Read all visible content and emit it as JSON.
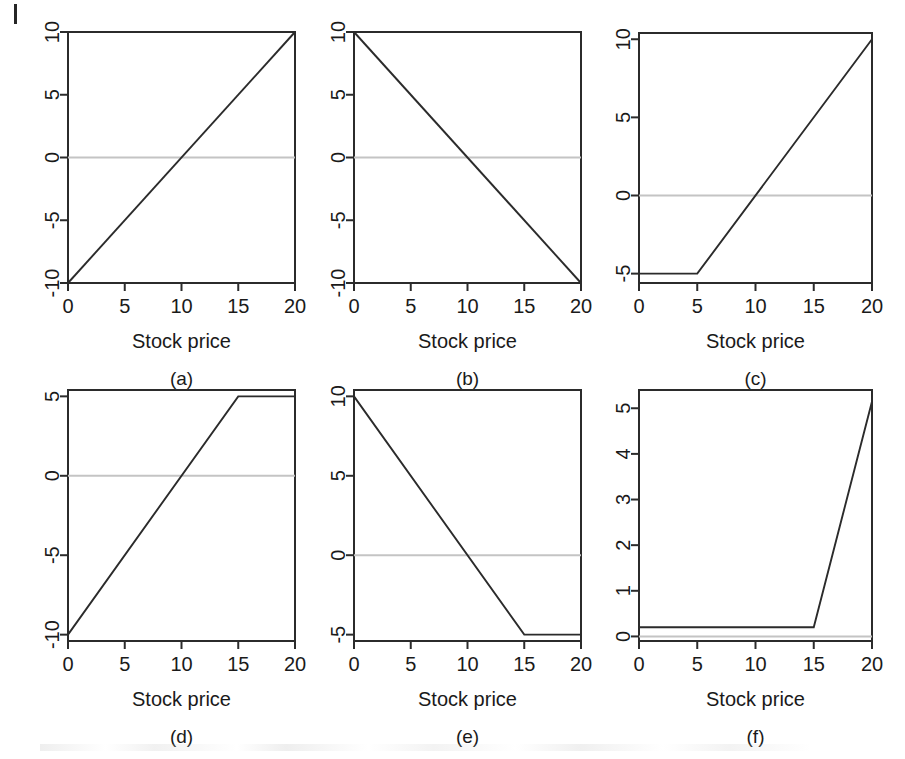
{
  "figure": {
    "panel_count": 6,
    "shared_xlabel": "Stock price",
    "panel_labels": [
      "(a)",
      "(b)",
      "(c)",
      "(d)",
      "(e)",
      "(f)"
    ],
    "line_color": "#2b2b2b",
    "zero_line_color": "#c4c4c4",
    "background_color": "#ffffff"
  },
  "chart_data": [
    {
      "type": "line",
      "panel": "(a)",
      "title": "",
      "xlabel": "Stock price",
      "ylabel": "",
      "xlim": [
        0,
        20
      ],
      "ylim": [
        -10,
        10
      ],
      "xticks": [
        0,
        5,
        10,
        15,
        20
      ],
      "xtick_labels": [
        "0",
        "5",
        "10",
        "15",
        "20"
      ],
      "yticks": [
        -10,
        -5,
        0,
        5,
        10
      ],
      "ytick_labels": [
        "-10",
        "-5",
        "0",
        "5",
        "10"
      ],
      "grid": false,
      "legend": "none",
      "series": [
        {
          "name": "payoff",
          "x": [
            0,
            20
          ],
          "values": [
            -10,
            10
          ]
        },
        {
          "name": "zero-line",
          "x": [
            0,
            20
          ],
          "values": [
            0,
            0
          ]
        }
      ]
    },
    {
      "type": "line",
      "panel": "(b)",
      "title": "",
      "xlabel": "Stock price",
      "ylabel": "",
      "xlim": [
        0,
        20
      ],
      "ylim": [
        -10,
        10
      ],
      "xticks": [
        0,
        5,
        10,
        15,
        20
      ],
      "xtick_labels": [
        "0",
        "5",
        "10",
        "15",
        "20"
      ],
      "yticks": [
        -10,
        -5,
        0,
        5,
        10
      ],
      "ytick_labels": [
        "-10",
        "-5",
        "0",
        "5",
        "10"
      ],
      "grid": false,
      "legend": "none",
      "series": [
        {
          "name": "payoff",
          "x": [
            0,
            20
          ],
          "values": [
            10,
            -10
          ]
        },
        {
          "name": "zero-line",
          "x": [
            0,
            20
          ],
          "values": [
            0,
            0
          ]
        }
      ]
    },
    {
      "type": "line",
      "panel": "(c)",
      "title": "",
      "xlabel": "Stock price",
      "ylabel": "",
      "xlim": [
        0,
        20
      ],
      "ylim": [
        -5.6,
        10.4
      ],
      "xticks": [
        0,
        5,
        10,
        15,
        20
      ],
      "xtick_labels": [
        "0",
        "5",
        "10",
        "15",
        "20"
      ],
      "yticks": [
        -5,
        0,
        5,
        10
      ],
      "ytick_labels": [
        "-5",
        "0",
        "5",
        "10"
      ],
      "grid": false,
      "legend": "none",
      "series": [
        {
          "name": "payoff",
          "x": [
            0,
            5,
            20
          ],
          "values": [
            -5,
            -5,
            10
          ]
        },
        {
          "name": "zero-line",
          "x": [
            0,
            20
          ],
          "values": [
            0,
            0
          ]
        }
      ]
    },
    {
      "type": "line",
      "panel": "(d)",
      "title": "",
      "xlabel": "Stock price",
      "ylabel": "",
      "xlim": [
        0,
        20
      ],
      "ylim": [
        -10.4,
        5.4
      ],
      "xticks": [
        0,
        5,
        10,
        15,
        20
      ],
      "xtick_labels": [
        "0",
        "5",
        "10",
        "15",
        "20"
      ],
      "yticks": [
        -10,
        -5,
        0,
        5
      ],
      "ytick_labels": [
        "-10",
        "-5",
        "0",
        "5"
      ],
      "grid": false,
      "legend": "none",
      "series": [
        {
          "name": "payoff",
          "x": [
            0,
            15,
            20
          ],
          "values": [
            -10,
            5,
            5
          ]
        },
        {
          "name": "zero-line",
          "x": [
            0,
            20
          ],
          "values": [
            0,
            0
          ]
        }
      ]
    },
    {
      "type": "line",
      "panel": "(e)",
      "title": "",
      "xlabel": "Stock price",
      "ylabel": "",
      "xlim": [
        0,
        20
      ],
      "ylim": [
        -5.4,
        10.4
      ],
      "xticks": [
        0,
        5,
        10,
        15,
        20
      ],
      "xtick_labels": [
        "0",
        "5",
        "10",
        "15",
        "20"
      ],
      "yticks": [
        -5,
        0,
        5,
        10
      ],
      "ytick_labels": [
        "-5",
        "0",
        "5",
        "10"
      ],
      "grid": false,
      "legend": "none",
      "series": [
        {
          "name": "payoff",
          "x": [
            0,
            15,
            20
          ],
          "values": [
            10,
            -5,
            -5
          ]
        },
        {
          "name": "zero-line",
          "x": [
            0,
            20
          ],
          "values": [
            0,
            0
          ]
        }
      ]
    },
    {
      "type": "line",
      "panel": "(f)",
      "title": "",
      "xlabel": "Stock price",
      "ylabel": "",
      "xlim": [
        0,
        20
      ],
      "ylim": [
        -0.1,
        5.4
      ],
      "xticks": [
        0,
        5,
        10,
        15,
        20
      ],
      "xtick_labels": [
        "0",
        "5",
        "10",
        "15",
        "20"
      ],
      "yticks": [
        0,
        1,
        2,
        3,
        4,
        5
      ],
      "ytick_labels": [
        "0",
        "1",
        "2",
        "3",
        "4",
        "5"
      ],
      "grid": false,
      "legend": "none",
      "series": [
        {
          "name": "payoff",
          "x": [
            0,
            15,
            20
          ],
          "values": [
            0.2,
            0.2,
            5.15
          ]
        },
        {
          "name": "zero-line",
          "x": [
            0,
            20
          ],
          "values": [
            0,
            0
          ]
        }
      ]
    }
  ]
}
